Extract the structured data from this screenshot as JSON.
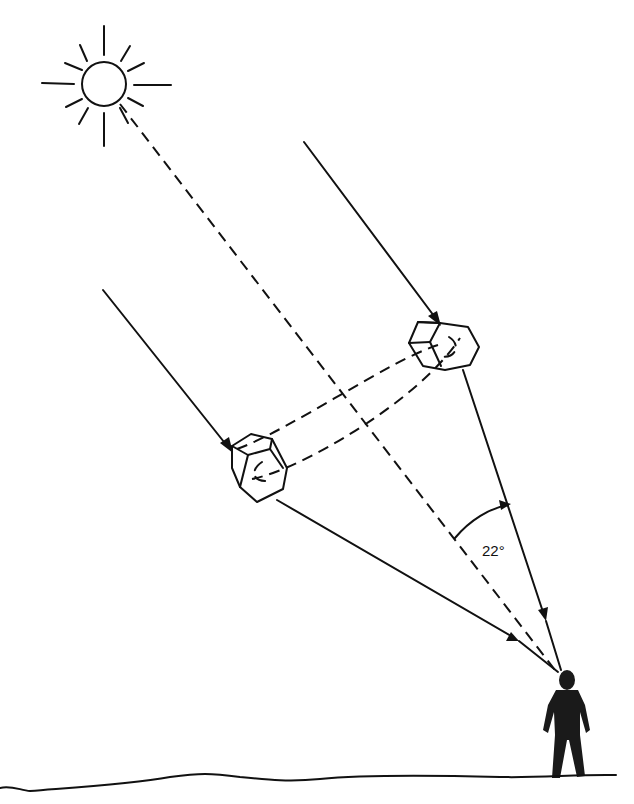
{
  "diagram": {
    "angle_label": "22°",
    "colors": {
      "ink": "#111111",
      "background": "#ffffff"
    },
    "elements": {
      "sun": {
        "cx": 104,
        "cy": 84,
        "r": 22
      },
      "crystal_upper": {
        "cx": 443,
        "cy": 345
      },
      "crystal_lower": {
        "cx": 259,
        "cy": 466
      },
      "observer": {
        "head_x": 566,
        "head_y": 680
      },
      "ground_y": 775
    }
  }
}
